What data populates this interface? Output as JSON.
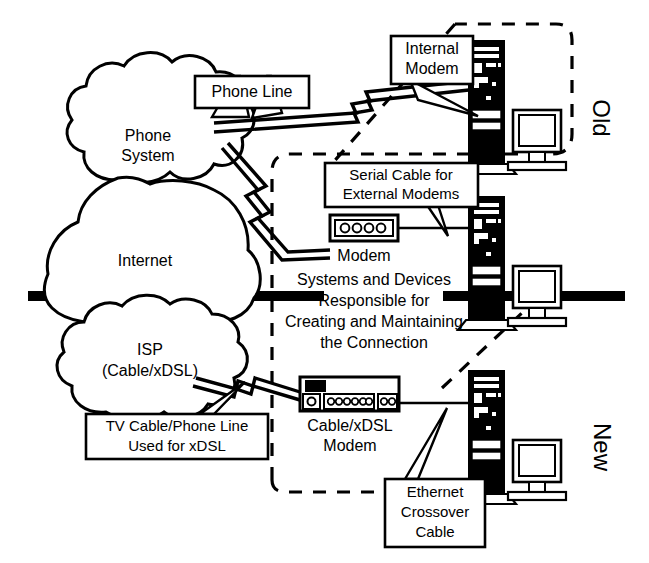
{
  "diagram": {
    "colors": {
      "ink": "#000000",
      "paper": "#ffffff"
    },
    "clouds": [
      {
        "name": "phone-system-cloud",
        "lines": [
          "Phone",
          "System"
        ]
      },
      {
        "name": "internet-cloud",
        "lines": [
          "Internet"
        ]
      },
      {
        "name": "isp-cloud",
        "lines": [
          "ISP",
          "(Cable/xDSL)"
        ]
      }
    ],
    "callouts": [
      {
        "name": "phone-line-callout",
        "lines": [
          "Phone Line"
        ]
      },
      {
        "name": "internal-modem-callout",
        "lines": [
          "Internal",
          "Modem"
        ]
      },
      {
        "name": "serial-cable-callout",
        "lines": [
          "Serial Cable for",
          "External Modems"
        ]
      },
      {
        "name": "tv-cable-callout",
        "lines": [
          "TV Cable/Phone Line",
          "Used for xDSL"
        ]
      },
      {
        "name": "ethernet-crossover-callout",
        "lines": [
          "Ethernet",
          "Crossover",
          "Cable"
        ]
      }
    ],
    "device_labels": [
      {
        "name": "modem-label",
        "lines": [
          "Modem"
        ]
      },
      {
        "name": "cable-xdsl-modem-label",
        "lines": [
          "Cable/xDSL",
          "Modem"
        ]
      }
    ],
    "center_note": {
      "name": "responsibility-note",
      "lines": [
        "Systems and Devices",
        "Responsible for",
        "Creating and Maintaining",
        "the Connection"
      ]
    },
    "section_labels": [
      {
        "name": "old-section-label",
        "text": "Old",
        "rotation": 90
      },
      {
        "name": "new-section-label",
        "text": "New",
        "rotation": 90
      }
    ],
    "cloud_text": {
      "phone_1": "Phone",
      "phone_2": "System",
      "internet_1": "Internet",
      "isp_1": "ISP",
      "isp_2": "(Cable/xDSL)"
    },
    "callout_text": {
      "phone_line": "Phone Line",
      "internal_modem_1": "Internal",
      "internal_modem_2": "Modem",
      "serial_cable_1": "Serial Cable for",
      "serial_cable_2": "External Modems",
      "tv_cable_1": "TV Cable/Phone Line",
      "tv_cable_2": "Used for xDSL",
      "ethernet_1": "Ethernet",
      "ethernet_2": "Crossover",
      "ethernet_3": "Cable"
    },
    "device_text": {
      "modem": "Modem",
      "cable_modem_1": "Cable/xDSL",
      "cable_modem_2": "Modem"
    },
    "note_text": {
      "l1": "Systems and Devices",
      "l2": "Responsible for",
      "l3": "Creating and Maintaining",
      "l4": "the Connection"
    },
    "section_text": {
      "old": "Old",
      "new": "New"
    }
  }
}
